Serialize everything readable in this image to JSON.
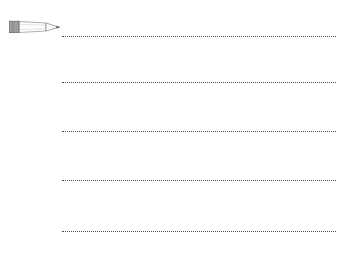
{
  "page": {
    "background_color": "#ffffff",
    "width": 342,
    "height": 265
  },
  "icon": {
    "name": "pencil-icon",
    "label": "Pencil",
    "body_fill": "#fdfdfd",
    "body_stroke": "#9a9a9a",
    "ferrule_fill": "#9e9e9e",
    "ferrule_stroke": "#6f6f6f",
    "tip_fill": "#ffffff",
    "tip_stroke": "#8a8a8a",
    "lead_fill": "#555555",
    "x": 8,
    "y": 18,
    "width": 54,
    "height": 18
  },
  "writing_lines": {
    "name": "dotted-writing-lines",
    "count": 5,
    "color": "#4a4a4a",
    "style": "dotted",
    "thickness": 1,
    "start_x": 62,
    "end_x": 336,
    "length": 274,
    "rows": [
      {
        "index": 1,
        "y": 36
      },
      {
        "index": 2,
        "y": 82
      },
      {
        "index": 3,
        "y": 131
      },
      {
        "index": 4,
        "y": 180
      },
      {
        "index": 5,
        "y": 231
      }
    ]
  }
}
